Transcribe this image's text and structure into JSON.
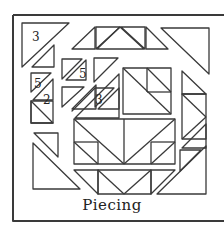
{
  "diagram": {
    "caption": "Piecing",
    "labels": [
      "3",
      "5",
      "5",
      "2",
      "3"
    ],
    "line_color": "#3a3a3a",
    "background": "#ffffff"
  }
}
